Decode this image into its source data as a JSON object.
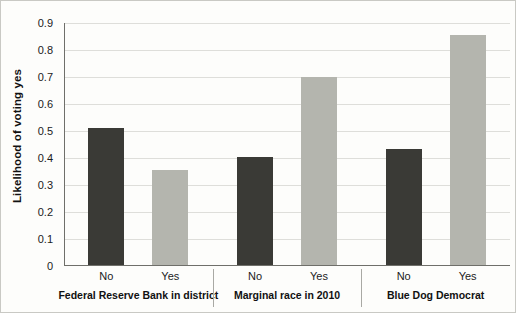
{
  "chart_data": {
    "type": "bar",
    "title": "",
    "xlabel": "",
    "ylabel": "Likelihood of voting yes",
    "ylim": [
      0,
      0.9
    ],
    "yticks": [
      "0",
      "0.1",
      "0.2",
      "0.3",
      "0.4",
      "0.5",
      "0.6",
      "0.7",
      "0.8",
      "0.9"
    ],
    "ytick_values": [
      0,
      0.1,
      0.2,
      0.3,
      0.4,
      0.5,
      0.6,
      0.7,
      0.8,
      0.9
    ],
    "grid": true,
    "legend": "none",
    "categories": [
      "No",
      "Yes",
      "No",
      "Yes",
      "No",
      "Yes"
    ],
    "values": [
      0.51,
      0.355,
      0.405,
      0.7,
      0.435,
      0.855
    ],
    "bar_styles": [
      "dark",
      "light",
      "dark",
      "light",
      "dark",
      "light"
    ],
    "colors": {
      "dark_bar": "#3a3a36",
      "light_bar": "#b4b5ae",
      "axis": "#6f6f6a",
      "gridline": "#dededa",
      "background": "#fdfdfb",
      "text": "#1b1b1b"
    },
    "groups": [
      {
        "label": "Federal Reserve Bank in district",
        "bars": [
          {
            "category": "No",
            "value": 0.51,
            "style": "dark"
          },
          {
            "category": "Yes",
            "value": 0.355,
            "style": "light"
          }
        ]
      },
      {
        "label": "Marginal race in 2010",
        "bars": [
          {
            "category": "No",
            "value": 0.405,
            "style": "dark"
          },
          {
            "category": "Yes",
            "value": 0.7,
            "style": "light"
          }
        ]
      },
      {
        "label": "Blue Dog Democrat",
        "bars": [
          {
            "category": "No",
            "value": 0.435,
            "style": "dark"
          },
          {
            "category": "Yes",
            "value": 0.855,
            "style": "light"
          }
        ]
      }
    ]
  }
}
